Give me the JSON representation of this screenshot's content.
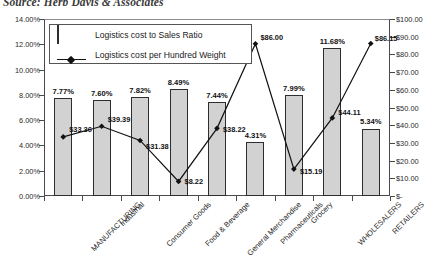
{
  "source_note": "Source: Herb Davis & Associates",
  "legend": {
    "position": "inside-top-left",
    "items": [
      {
        "key": "bar-key",
        "label": "Logistics cost to Sales Ratio"
      },
      {
        "key": "line-key",
        "label": "Logistics cost per Hundred Weight"
      }
    ]
  },
  "axes": {
    "left_ticks": [
      "0.00%",
      "2.00%",
      "4.00%",
      "6.00%",
      "8.00%",
      "10.00%",
      "12.00%",
      "14.00%"
    ],
    "right_ticks": [
      "$-",
      "$10.00",
      "$20.00",
      "$30.00",
      "$40.00",
      "$50.00",
      "$60.00",
      "$70.00",
      "$80.00",
      "$90.00",
      "$100.00"
    ]
  },
  "colors": {
    "bar_fill": "#d2d2d2",
    "bar_border": "#2e2e2e",
    "line": "#111111",
    "axis": "#4a4a4a",
    "text": "#1a1a1a"
  },
  "chart_data": {
    "type": "bar",
    "title": "",
    "subtitle": "",
    "xlabel": "",
    "ylabel": "",
    "grid": false,
    "legend_position": "inside-top-left",
    "categories": [
      "MANUFACTURING",
      "Industrial",
      "Consumer Goods",
      "Food & Beverage",
      "General Merchandise",
      "Pharmaceuticals",
      "Grocery",
      "WHOLESALERS",
      "RETAILERS"
    ],
    "series": [
      {
        "name": "Logistics cost to Sales Ratio",
        "type": "bar",
        "axis": "left",
        "ylim": [
          0,
          14
        ],
        "unit": "percent",
        "values": [
          7.77,
          7.6,
          7.82,
          8.49,
          7.44,
          4.31,
          7.99,
          11.68,
          5.34
        ],
        "labels": [
          "7.77%",
          "7.60%",
          "7.82%",
          "8.49%",
          "7.44%",
          "4.31%",
          "7.99%",
          "11.68%",
          "5.34%"
        ]
      },
      {
        "name": "Logistics cost per Hundred Weight",
        "type": "line",
        "axis": "right",
        "ylim": [
          0,
          100
        ],
        "unit": "dollars",
        "values": [
          33.36,
          39.39,
          31.38,
          8.22,
          38.22,
          86.0,
          15.19,
          44.11,
          86.15
        ],
        "labels": [
          "$33.36",
          "$39.39",
          "$31.38",
          "$8.22",
          "$38.22",
          "$86.00",
          "$15.19",
          "$44.11",
          "$86.15"
        ]
      }
    ]
  }
}
